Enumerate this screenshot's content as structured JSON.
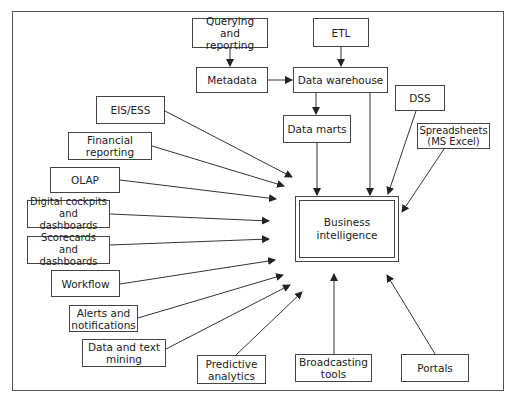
{
  "diagram": {
    "center": {
      "label": "Business\nintelligence"
    },
    "nodes": {
      "querying": "Querying and\nreporting",
      "etl": "ETL",
      "metadata": "Metadata",
      "data_warehouse": "Data warehouse",
      "data_marts": "Data marts",
      "dss": "DSS",
      "spreadsheets": "Spreadsheets\n(MS Excel)",
      "eis_ess": "EIS/ESS",
      "financial_reporting": "Financial\nreporting",
      "olap": "OLAP",
      "digital_cockpits": "Digital cockpits\nand dashboards",
      "scorecards": "Scorecards and\ndashboards",
      "workflow": "Workflow",
      "alerts": "Alerts and\nnotifications",
      "data_text_mining": "Data and text\nmining",
      "predictive_analytics": "Predictive\nanalytics",
      "broadcasting_tools": "Broadcasting\ntools",
      "portals": "Portals"
    },
    "edges": [
      [
        "Querying and reporting",
        "Metadata"
      ],
      [
        "ETL",
        "Data warehouse"
      ],
      [
        "Metadata",
        "Data warehouse"
      ],
      [
        "Data warehouse",
        "Data marts"
      ],
      [
        "Data warehouse",
        "Business intelligence"
      ],
      [
        "Data marts",
        "Business intelligence"
      ],
      [
        "DSS",
        "Business intelligence"
      ],
      [
        "Spreadsheets (MS Excel)",
        "Business intelligence"
      ],
      [
        "EIS/ESS",
        "Business intelligence"
      ],
      [
        "Financial reporting",
        "Business intelligence"
      ],
      [
        "OLAP",
        "Business intelligence"
      ],
      [
        "Digital cockpits and dashboards",
        "Business intelligence"
      ],
      [
        "Scorecards and dashboards",
        "Business intelligence"
      ],
      [
        "Workflow",
        "Business intelligence"
      ],
      [
        "Alerts and notifications",
        "Business intelligence"
      ],
      [
        "Data and text mining",
        "Business intelligence"
      ],
      [
        "Predictive analytics",
        "Business intelligence"
      ],
      [
        "Broadcasting tools",
        "Business intelligence"
      ],
      [
        "Portals",
        "Business intelligence"
      ]
    ]
  }
}
